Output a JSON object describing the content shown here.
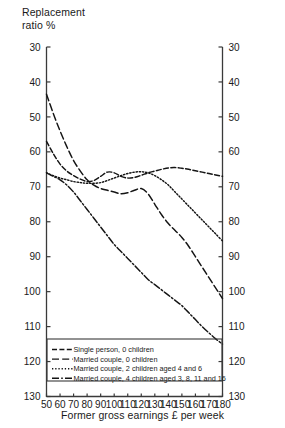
{
  "chart_data": {
    "type": "line",
    "title": "",
    "ylabel": "Replacement\nratio %",
    "xlabel": "Former gross earnings £ per week",
    "xlim": [
      50,
      180
    ],
    "ylim": [
      30,
      130
    ],
    "xticks": [
      50,
      60,
      70,
      80,
      90,
      100,
      110,
      120,
      130,
      140,
      150,
      160,
      170,
      180
    ],
    "yticks": [
      30,
      40,
      50,
      60,
      70,
      80,
      90,
      100,
      110,
      120,
      130
    ],
    "grid": false,
    "legend_position": "bottom-left-inside",
    "dual_y_axis": true,
    "x": [
      50,
      55,
      60,
      65,
      70,
      75,
      80,
      85,
      90,
      95,
      100,
      105,
      110,
      115,
      120,
      125,
      130,
      135,
      140,
      145,
      150,
      155,
      160,
      165,
      170,
      175,
      180
    ],
    "series": [
      {
        "name": "Single person, 0 children",
        "linestyle": "dashed",
        "dasharray": "5,2.4",
        "values": [
          103.0,
          99.5,
          96.5,
          94.5,
          93.2,
          92.2,
          91.5,
          91.8,
          93.0,
          94.2,
          94.0,
          93.0,
          92.5,
          92.7,
          93.3,
          94.0,
          94.5,
          95.0,
          95.4,
          95.5,
          95.3,
          95.0,
          94.6,
          94.2,
          93.8,
          93.4,
          93.0
        ]
      },
      {
        "name": "Married couple, 0 children",
        "linestyle": "long-dash",
        "dasharray": "7,3.2",
        "values": [
          116.5,
          111.0,
          106.0,
          101.5,
          97.5,
          94.5,
          92.0,
          90.5,
          89.5,
          89.0,
          88.5,
          88.0,
          88.3,
          89.0,
          89.5,
          88.0,
          85.0,
          82.0,
          79.5,
          77.5,
          75.5,
          73.0,
          70.0,
          67.0,
          64.0,
          61.0,
          58.0
        ]
      },
      {
        "name": "Married couple, 2 children aged 4 and 6",
        "linestyle": "dotted",
        "dasharray": "1.3,1.9",
        "values": [
          94.0,
          93.2,
          92.5,
          92.0,
          91.5,
          91.2,
          91.0,
          91.0,
          91.2,
          91.8,
          92.5,
          93.2,
          93.8,
          94.2,
          94.3,
          94.0,
          93.2,
          92.0,
          90.5,
          88.5,
          86.5,
          84.5,
          82.5,
          80.5,
          78.5,
          76.5,
          74.5
        ]
      },
      {
        "name": "Married couple, 4 children aged 3, 8, 11 and 16",
        "linestyle": "dash-dot",
        "dasharray": "7,2.2,1.6,2.2",
        "values": [
          94.0,
          93.0,
          92.0,
          90.5,
          88.5,
          86.0,
          83.5,
          81.0,
          78.5,
          76.0,
          73.5,
          71.5,
          69.5,
          67.5,
          65.5,
          63.5,
          62.0,
          60.5,
          59.0,
          57.5,
          56.0,
          54.0,
          52.0,
          50.0,
          48.2,
          46.5,
          45.0
        ]
      }
    ]
  },
  "axes": {
    "left_tick_labels": [
      "130",
      "120",
      "110",
      "100",
      "90",
      "80",
      "70",
      "60",
      "50",
      "40",
      "30"
    ],
    "right_tick_labels": [
      "130",
      "120",
      "110",
      "100",
      "90",
      "80",
      "70",
      "60",
      "50",
      "40",
      "30"
    ],
    "x_tick_labels": [
      "50",
      "60",
      "70",
      "80",
      "90",
      "100",
      "110",
      "120",
      "130",
      "140",
      "150",
      "160",
      "170",
      "180"
    ]
  },
  "legend": {
    "items": [
      {
        "label": "Single person, 0 children",
        "style": "dashed"
      },
      {
        "label": "Married couple, 0 children",
        "style": "long-dash"
      },
      {
        "label": "Married couple, 2 children aged 4 and 6",
        "style": "dotted"
      },
      {
        "label": "Married couple, 4 children aged 3, 8, 11 and 16",
        "style": "dash-dot"
      }
    ]
  },
  "colors": {
    "ink": "#141414",
    "axis": "#3a3a3a",
    "background": "#ffffff"
  }
}
